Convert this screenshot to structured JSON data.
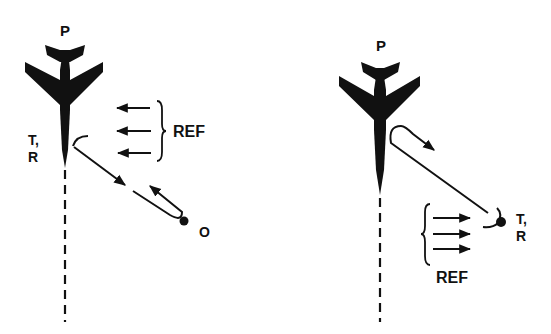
{
  "colors": {
    "ink": "#111111",
    "background": "#ffffff"
  },
  "panels": [
    {
      "id": "left",
      "aircraft_label": "P",
      "tr_label_line1": "T,",
      "tr_label_line2": "R",
      "ref_label": "REF",
      "object_label": "O",
      "description": "Transmitter/receiver on aircraft P; reference waves arrive from right; ray goes to object O and returns"
    },
    {
      "id": "right",
      "aircraft_label": "P",
      "tr_label_line1": "T,",
      "tr_label_line2": "R",
      "ref_label": "REF",
      "description": "Transmitter/receiver at remote point; reference waves travel rightward; ray goes to aircraft P and returns"
    }
  ]
}
